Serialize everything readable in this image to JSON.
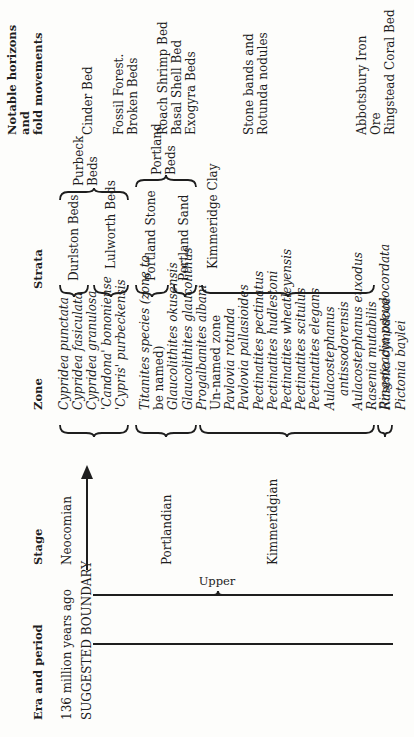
{
  "headers": {
    "era": "Era and period",
    "stage": "Stage",
    "zone": "Zone",
    "strata": "Strata",
    "notable": [
      "Notable horizons",
      "and",
      "fold movements"
    ]
  },
  "era": {
    "age": "136 million years ago",
    "boundary": "SUGGESTED BOUNDARY",
    "subdivision": "Upper"
  },
  "stages": {
    "neocomian": "Neocomian",
    "portlandian": "Portlandian",
    "kimmeridgian": "Kimmeridgian"
  },
  "zones": {
    "purbeck": [
      "Cypridea punctata",
      "Cypridea fasiculata",
      "Cypridea granulosa",
      "'Candona' bononiense",
      "'Cypris' purbeckensis"
    ],
    "portland": [
      "Titanites species (zone to",
      "be named)",
      "Glaucolithites okusensis",
      "Glaucolithites glaucolithus",
      "Progalbanites albani"
    ],
    "kimmeridge": [
      "Un-named zone",
      "Pavlovia rotunda",
      "Pavlovia pallasioides",
      "Pectinatites pectinatus",
      "Pectinatites hudlestoni",
      "Pectinatites wheatleyensis",
      "Pectinatites scitulus",
      "Pectinatites elegans",
      "Aulacostephanus",
      "antissodorensis",
      "Aulacostephanus euxodus",
      "Rasenia mutabilis",
      "Rasenia cymodoce",
      "Pictonia baylei"
    ],
    "corallian": "Ringsteadia pseudocordata"
  },
  "strata": {
    "durlston": "Durlston Beds",
    "lulworth": "Lulworth Beds",
    "purbeck": [
      "Purbeck",
      "Beds"
    ],
    "portland_stone": "Portland Stone",
    "portland_sand": "Portland Sand",
    "portland": [
      "Portland",
      "Beds"
    ],
    "kimmeridge_clay": "Kimmeridge Clay"
  },
  "notable": {
    "cinder": "Cinder Bed",
    "fossil_forest": [
      "Fossil Forest.",
      "Broken Beds"
    ],
    "portland_horizons": [
      "Roach Shrimp Bed",
      "Basal Shell Bed",
      "Exogyra Beds"
    ],
    "stone_bands": [
      "Stone bands and",
      "Rotunda nodules"
    ],
    "abbotsbury": [
      "Abbotsbury Iron",
      "Ore",
      "Ringstead Coral Bed"
    ]
  }
}
